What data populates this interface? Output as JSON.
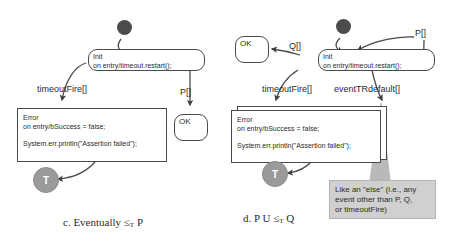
{
  "figure": {
    "type": "uml-statechart-pair",
    "background": "#ffffff",
    "ink_color": "#4a4a4a",
    "terminal_fill": "#9a9a9a",
    "initial_fill": "#4b4b4b",
    "note_fill": "#d0d0d0"
  },
  "diagram_c": {
    "caption_prefix": "c. Eventually",
    "caption_operator": "≤",
    "caption_subscript": "T",
    "caption_suffix": "P",
    "initial_state": "initial-state",
    "init_state": {
      "name": "Init",
      "body": "on entry/timeout.restart();"
    },
    "error_state": {
      "name": "Error",
      "line1": "on entry/bSuccess = false;",
      "line2": "System.err.println(\"Assertion failed\");"
    },
    "ok_state": {
      "name": "OK"
    },
    "terminal_state": {
      "label": "T"
    },
    "transitions": {
      "timeout_fire": "timeoutFire[]",
      "p": "P[]"
    }
  },
  "diagram_d": {
    "caption_prefix": "d. P U",
    "caption_operator": "≤",
    "caption_subscript": "T",
    "caption_suffix": "Q",
    "initial_state": "initial-state",
    "init_state": {
      "name": "Init",
      "body": "on entry/timeout.restart();"
    },
    "error_state": {
      "name": "Error",
      "line1": "on entry/bSuccess = false;",
      "line2": "System.err.println(\"Assertion failed\");"
    },
    "ok_state": {
      "name": "OK"
    },
    "terminal_state": {
      "label": "T"
    },
    "transitions": {
      "q": "Q[]",
      "p": "P[]",
      "timeout_fire": "timeoutFire[]",
      "event_tr_default": "eventTRdefault[]"
    },
    "note": {
      "line1": "Like an \"else\" (i.e., any",
      "line2": "event other than P, Q,",
      "line3": "or timeoutFire)"
    }
  }
}
